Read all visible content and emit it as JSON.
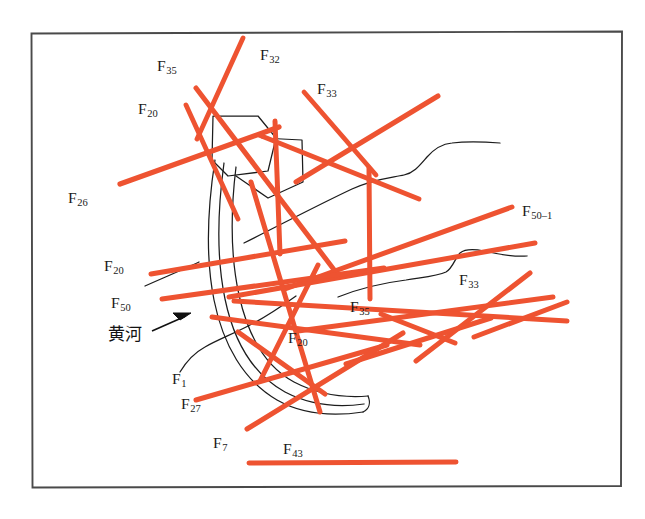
{
  "figure": {
    "kind": "geological-fault-distribution-map",
    "frame": {
      "border_color": "#4a4a4a",
      "background": "#ffffff"
    },
    "colors": {
      "fault_line": "#ee5331",
      "boundary_line": "#1c1c1c",
      "text": "#1a1a1a"
    },
    "labels": [
      {
        "id": "f32",
        "prefix": "F",
        "subscript": "32",
        "x": 260,
        "y": 47,
        "name": "fault-label-f32"
      },
      {
        "id": "f35a",
        "prefix": "F",
        "subscript": "35",
        "x": 157,
        "y": 58,
        "name": "fault-label-f35-upper"
      },
      {
        "id": "f33a",
        "prefix": "F",
        "subscript": "33",
        "x": 317,
        "y": 81,
        "name": "fault-label-f33-upper"
      },
      {
        "id": "f20a",
        "prefix": "F",
        "subscript": "20",
        "x": 138,
        "y": 101,
        "name": "fault-label-f20-upper"
      },
      {
        "id": "f26",
        "prefix": "F",
        "subscript": "26",
        "x": 68,
        "y": 190,
        "name": "fault-label-f26"
      },
      {
        "id": "f50_1",
        "prefix": "F",
        "subscript": "50–1",
        "x": 522,
        "y": 203,
        "name": "fault-label-f50-1"
      },
      {
        "id": "f20b",
        "prefix": "F",
        "subscript": "20",
        "x": 104,
        "y": 258,
        "name": "fault-label-f20-mid"
      },
      {
        "id": "f33b",
        "prefix": "F",
        "subscript": "33",
        "x": 459,
        "y": 272,
        "name": "fault-label-f33-right"
      },
      {
        "id": "f50",
        "prefix": "F",
        "subscript": "50",
        "x": 111,
        "y": 295,
        "name": "fault-label-f50"
      },
      {
        "id": "f35b",
        "prefix": "F",
        "subscript": "35",
        "x": 350,
        "y": 299,
        "name": "fault-label-f35-lower"
      },
      {
        "id": "f20c",
        "prefix": "F",
        "subscript": "20",
        "x": 288,
        "y": 330,
        "name": "fault-label-f20-lower"
      },
      {
        "id": "f1",
        "prefix": "F",
        "subscript": "1",
        "x": 172,
        "y": 371,
        "name": "fault-label-f1"
      },
      {
        "id": "f27",
        "prefix": "F",
        "subscript": "27",
        "x": 181,
        "y": 396,
        "name": "fault-label-f27"
      },
      {
        "id": "f7",
        "prefix": "F",
        "subscript": "7",
        "x": 213,
        "y": 435,
        "name": "fault-label-f7"
      },
      {
        "id": "f43",
        "prefix": "F",
        "subscript": "43",
        "x": 283,
        "y": 441,
        "name": "fault-label-f43"
      }
    ],
    "river": {
      "label": "黄河",
      "x": 108,
      "y": 326,
      "name": "river-label-huanghe"
    },
    "fault_lines": [
      {
        "name": "fault-line-f32",
        "points": "241,38 199,137",
        "width": 5.0
      },
      {
        "name": "fault-line-f35u",
        "points": "195,88 332,268",
        "width": 5.2
      },
      {
        "name": "fault-line-f20u",
        "points": "186,105 236,216",
        "width": 5.0
      },
      {
        "name": "fault-line-f33u",
        "points": "303,91 374,173",
        "width": 5.0
      },
      {
        "name": "fault-line-ne-long",
        "points": "437,96 297,182",
        "width": 5.0
      },
      {
        "name": "fault-line-f33-vert",
        "points": "368,167 369,298",
        "width": 5.0
      },
      {
        "name": "fault-line-mid-vert",
        "points": "274,120 279,252",
        "width": 5.0
      },
      {
        "name": "fault-line-f26",
        "points": "121,183 277,128",
        "width": 5.2
      },
      {
        "name": "fault-line-diag-ne",
        "points": "418,198 260,134",
        "width": 5.0
      },
      {
        "name": "fault-line-50-1a",
        "points": "510,208 284,287",
        "width": 5.0
      },
      {
        "name": "fault-line-50-1b",
        "points": "533,243 230,296",
        "width": 5.0
      },
      {
        "name": "fault-line-f20m",
        "points": "152,273 341,240",
        "width": 5.0
      },
      {
        "name": "fault-line-f50",
        "points": "163,298 380,268",
        "width": 5.0
      },
      {
        "name": "fault-line-low1",
        "points": "551,298 300,330",
        "width": 5.0
      },
      {
        "name": "fault-line-low2",
        "points": "565,320 236,300",
        "width": 5.0
      },
      {
        "name": "fault-line-f33r",
        "points": "528,274 418,359",
        "width": 5.0
      },
      {
        "name": "fault-line-f35l",
        "points": "488,319 349,363",
        "width": 5.0
      },
      {
        "name": "fault-line-f20l",
        "points": "417,346 214,316",
        "width": 5.0
      },
      {
        "name": "fault-line-f1",
        "points": "250,182 318,410",
        "width": 5.0
      },
      {
        "name": "fault-line-f27",
        "points": "197,399 383,346",
        "width": 5.0
      },
      {
        "name": "fault-line-f7",
        "points": "248,428 400,335",
        "width": 5.0
      },
      {
        "name": "fault-line-f43",
        "points": "249,463 455,462",
        "width": 5.0
      },
      {
        "name": "fault-line-cross1",
        "points": "239,330 322,391",
        "width": 5.0
      },
      {
        "name": "fault-line-cross2",
        "points": "316,266 262,380",
        "width": 5.0
      }
    ],
    "boundary_outlines": [
      {
        "name": "boundary-polygon-upper",
        "kind": "polygon"
      },
      {
        "name": "boundary-polygon-right",
        "kind": "polygon"
      },
      {
        "name": "river-channel-outline",
        "kind": "channel"
      },
      {
        "name": "boundary-curve-upper",
        "kind": "curve"
      },
      {
        "name": "boundary-curve-lower",
        "kind": "curve"
      },
      {
        "name": "boundary-curve-left",
        "kind": "curve"
      }
    ]
  }
}
